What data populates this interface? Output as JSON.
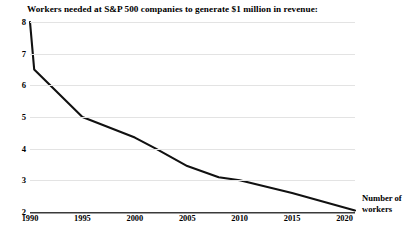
{
  "chart_data": {
    "type": "line",
    "title": "Workers needed at S&P 500 companies to generate $1 million in revenue:",
    "xlabel": "",
    "ylabel": "Number of workers",
    "ylabel_lines": [
      "Number of",
      "workers"
    ],
    "xlim": [
      1990,
      2021
    ],
    "ylim": [
      2,
      8
    ],
    "grid": true,
    "legend": "none",
    "x_ticks": [
      1990,
      1995,
      2000,
      2005,
      2010,
      2015,
      2020
    ],
    "x_tick_labels": [
      "1990",
      "1995",
      "2000",
      "2005",
      "2010",
      "2015",
      "2020"
    ],
    "y_ticks": [
      2,
      3,
      4,
      5,
      6,
      7,
      8
    ],
    "y_tick_labels": [
      "2",
      "3",
      "4",
      "5",
      "6",
      "7",
      "8"
    ],
    "line_color": "#111111",
    "gridline_color": "#e3e3e3",
    "axis_color": "#3a3a3a",
    "series": [
      {
        "name": "Workers per $1 million in revenue",
        "x": [
          1990,
          1990.4,
          1995,
          2000,
          2002,
          2005,
          2008,
          2010,
          2015,
          2021
        ],
        "values": [
          8.0,
          6.5,
          5.0,
          4.35,
          4.0,
          3.45,
          3.1,
          3.0,
          2.6,
          2.05
        ]
      }
    ]
  },
  "annotation": {
    "line1": "Number of",
    "line2": "workers"
  }
}
